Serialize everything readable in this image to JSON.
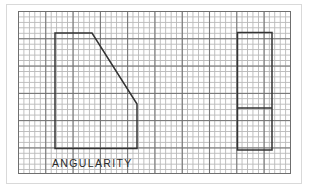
{
  "figure": {
    "title": "ANGULARITY",
    "caption": "ANGULARITY",
    "sheet": {
      "background_color": "#ffffff",
      "frame_color": "#d9d9d9"
    },
    "grid": {
      "minor_color": "#b9b9b9",
      "major_color": "#6f6f6f",
      "minor_cell_px": 5.46,
      "major_every_cells": 5,
      "columns": 50,
      "rows": 30
    },
    "line_color": "#333333",
    "views": [
      {
        "name": "profile-view",
        "label": "chamfered profile",
        "outline_points": "55,33 92,33 137,104 137,148 55,148 55,33",
        "features": [
          {
            "name": "top-edge",
            "kind": "line"
          },
          {
            "name": "chamfer-diagonal",
            "kind": "line"
          },
          {
            "name": "right-edge",
            "kind": "line"
          },
          {
            "name": "bottom-edge",
            "kind": "line"
          },
          {
            "name": "left-edge",
            "kind": "line"
          }
        ]
      },
      {
        "name": "end-view",
        "label": "rectangular end view",
        "outline_points": "237,32 272,32 272,150 237,150 237,32",
        "features": [
          {
            "name": "internal-divider-line",
            "kind": "line",
            "y": 108
          }
        ]
      }
    ]
  }
}
